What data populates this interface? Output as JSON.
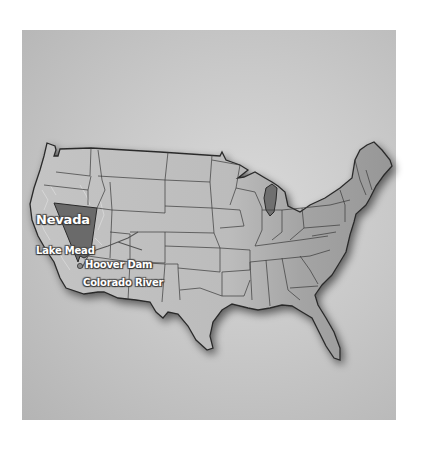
{
  "map": {
    "title": "Continental United States",
    "highlighted_state": "Nevada",
    "labels": {
      "nevada": "Nevada",
      "lake_mead": "Lake Mead",
      "hoover_dam": "Hoover Dam",
      "colorado_river": "Colorado River"
    },
    "colors": {
      "background": "#ffffff",
      "panel": "#c9c9c9",
      "land": "#bdbdbd",
      "land_east": "#9e9e9e",
      "nevada": "#6e6e6e",
      "border": "#333333",
      "label_text": "#ffffff"
    }
  }
}
